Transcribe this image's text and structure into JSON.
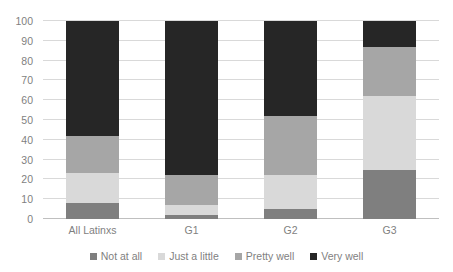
{
  "chart_data": {
    "type": "bar",
    "subtype": "stacked-bar-100",
    "title": "",
    "xlabel": "",
    "ylabel": "",
    "categories": [
      "All Latinxs",
      "G1",
      "G2",
      "G3"
    ],
    "series": [
      {
        "name": "Not at all",
        "color": "#7f7f7f",
        "values": [
          8,
          2,
          5,
          25
        ]
      },
      {
        "name": "Just a little",
        "color": "#d9d9d9",
        "values": [
          15,
          5,
          17,
          37
        ]
      },
      {
        "name": "Pretty well",
        "color": "#a6a6a6",
        "values": [
          19,
          15,
          30,
          25
        ]
      },
      {
        "name": "Very well",
        "color": "#262626",
        "values": [
          58,
          78,
          48,
          13
        ]
      }
    ],
    "ylim": [
      0,
      100
    ],
    "yticks": [
      0,
      10,
      20,
      30,
      40,
      50,
      60,
      70,
      80,
      90,
      100
    ],
    "ytick_labels": [
      "0",
      "10",
      "20",
      "30",
      "40",
      "50",
      "60",
      "70",
      "80",
      "90",
      "100"
    ],
    "grid": true,
    "legend_position": "bottom",
    "axis_text_color": "#7f7f7f",
    "gridline_color": "#d9d9d9",
    "background_color": "#ffffff"
  },
  "legend": {
    "items": [
      {
        "label": "Not at all",
        "color": "#7f7f7f"
      },
      {
        "label": "Just a little",
        "color": "#d9d9d9"
      },
      {
        "label": "Pretty well",
        "color": "#a6a6a6"
      },
      {
        "label": "Very well",
        "color": "#262626"
      }
    ]
  }
}
